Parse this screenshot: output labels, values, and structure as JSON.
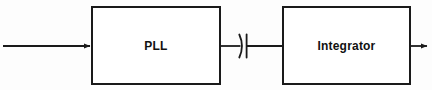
{
  "diagram": {
    "type": "block-diagram",
    "title": "",
    "background_color": "#fdfdfd",
    "line_color": "#1a1a1a",
    "blocks": [
      {
        "id": "pll",
        "label": "PLL",
        "x": 91,
        "y": 6,
        "width": 130,
        "height": 79
      },
      {
        "id": "integrator",
        "label": "Integrator",
        "x": 282,
        "y": 6,
        "width": 129,
        "height": 79
      }
    ],
    "components": [
      {
        "id": "coupling-capacitor",
        "type": "capacitor",
        "label": "",
        "x": 239,
        "y": 46,
        "orientation": "horizontal",
        "style": "polarized"
      }
    ],
    "connections": [
      {
        "id": "input-signal",
        "from": "external-input",
        "to": "pll",
        "arrow": "end",
        "y": 46,
        "x_start": 3,
        "x_end": 91
      },
      {
        "id": "pll-to-capacitor",
        "from": "pll",
        "to": "coupling-capacitor",
        "arrow": "none",
        "y": 46,
        "x_start": 221,
        "x_end": 240
      },
      {
        "id": "capacitor-to-integrator",
        "from": "coupling-capacitor",
        "to": "integrator",
        "arrow": "none",
        "y": 46,
        "x_start": 247,
        "x_end": 282
      },
      {
        "id": "output-signal",
        "from": "integrator",
        "to": "external-output",
        "arrow": "end",
        "y": 46,
        "x_start": 411,
        "x_end": 428
      }
    ]
  }
}
